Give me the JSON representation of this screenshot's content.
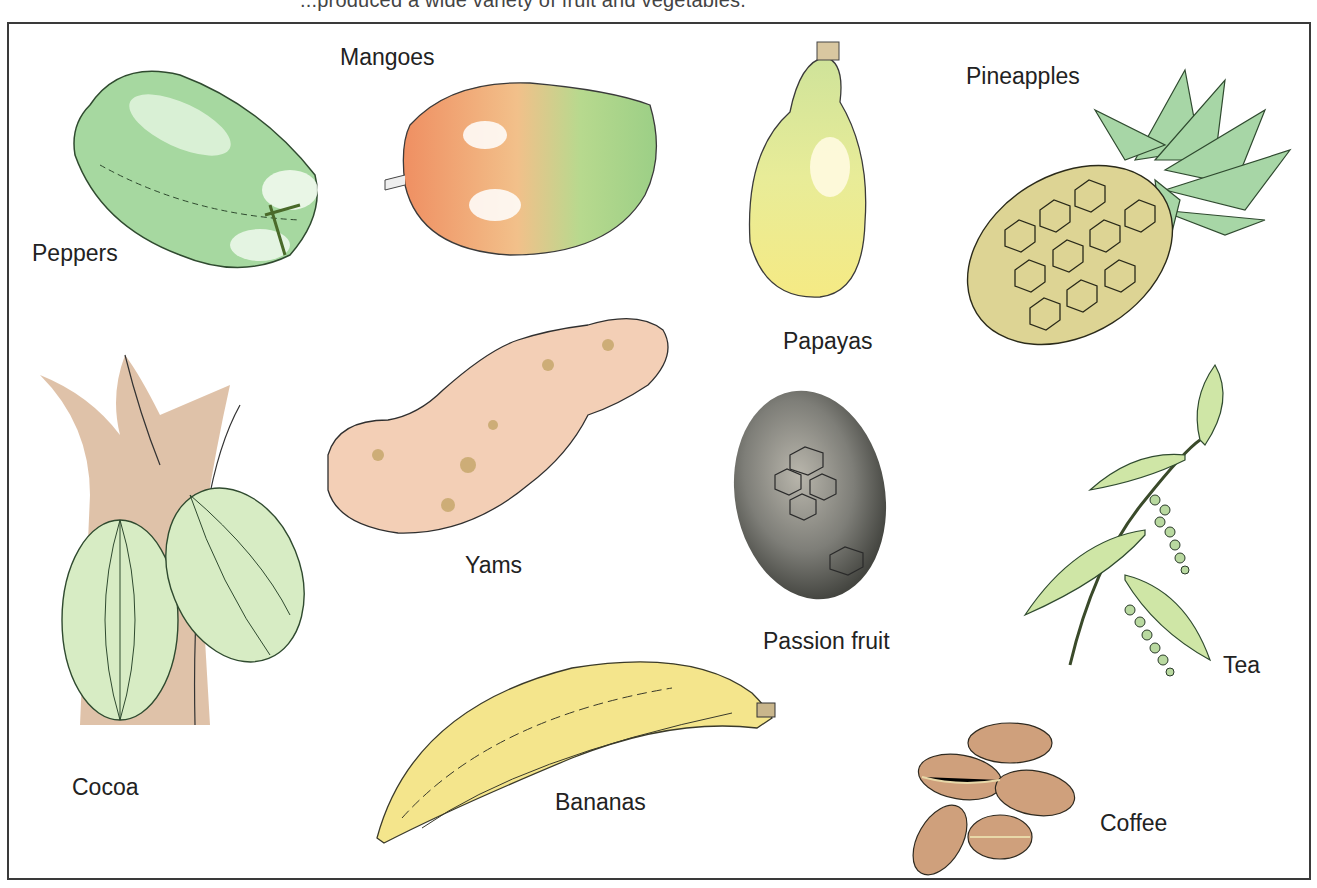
{
  "caption": "...produced a wide variety of fruit and vegetables.",
  "illustration": {
    "items": [
      {
        "id": "peppers",
        "label": "Peppers"
      },
      {
        "id": "mangoes",
        "label": "Mangoes"
      },
      {
        "id": "papayas",
        "label": "Papayas"
      },
      {
        "id": "pineapples",
        "label": "Pineapples"
      },
      {
        "id": "cocoa",
        "label": "Cocoa"
      },
      {
        "id": "yams",
        "label": "Yams"
      },
      {
        "id": "passion_fruit",
        "label": "Passion fruit"
      },
      {
        "id": "tea",
        "label": "Tea"
      },
      {
        "id": "bananas",
        "label": "Bananas"
      },
      {
        "id": "coffee",
        "label": "Coffee"
      }
    ]
  },
  "colors": {
    "pepper_green": "#9fd49a",
    "mango_orange": "#ef9a6a",
    "mango_green": "#a9d48c",
    "papaya_yellow": "#f0ea8a",
    "pineapple_body": "#d8cf8c",
    "pineapple_leaf": "#9fd0a0",
    "cocoa_trunk": "#d9b89c",
    "cocoa_pod": "#d6ecc0",
    "yam": "#f2cdb3",
    "passion_fruit": "#6f706b",
    "tea_leaf": "#cfe6a6",
    "banana": "#f4e68c",
    "coffee": "#c99a73",
    "frame": "#3a3a3a"
  }
}
